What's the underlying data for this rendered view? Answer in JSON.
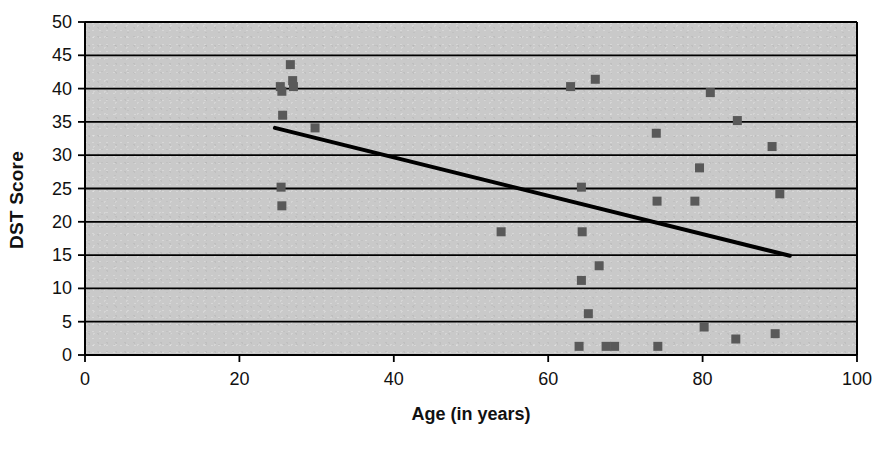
{
  "chart_data": {
    "type": "scatter",
    "title": "",
    "xlabel": "Age (in years)",
    "ylabel": "DST Score",
    "xlim": [
      0,
      100
    ],
    "ylim": [
      0,
      50
    ],
    "xticks": [
      0,
      20,
      40,
      60,
      80,
      100
    ],
    "yticks": [
      0,
      5,
      10,
      15,
      20,
      25,
      30,
      35,
      40,
      45,
      50
    ],
    "grid": "horizontal",
    "legend": "none",
    "plot_background_color": "#c9c9c9",
    "marker_color": "#595959",
    "marker_shape": "square",
    "trendline_color": "#000000",
    "series": [
      {
        "name": "DST Score by Age",
        "points": [
          [
            25.3,
            40.3
          ],
          [
            25.5,
            39.6
          ],
          [
            25.6,
            36.0
          ],
          [
            25.4,
            25.2
          ],
          [
            25.5,
            22.4
          ],
          [
            26.6,
            43.6
          ],
          [
            26.9,
            41.2
          ],
          [
            27.0,
            40.3
          ],
          [
            29.8,
            34.1
          ],
          [
            53.9,
            18.5
          ],
          [
            62.9,
            40.3
          ],
          [
            64.3,
            25.2
          ],
          [
            64.4,
            18.5
          ],
          [
            64.3,
            11.2
          ],
          [
            64.0,
            1.3
          ],
          [
            65.2,
            6.2
          ],
          [
            66.1,
            41.4
          ],
          [
            66.6,
            13.4
          ],
          [
            67.5,
            1.3
          ],
          [
            68.6,
            1.3
          ],
          [
            74.0,
            33.3
          ],
          [
            74.1,
            23.1
          ],
          [
            74.2,
            1.3
          ],
          [
            79.0,
            23.1
          ],
          [
            79.6,
            28.1
          ],
          [
            80.2,
            4.2
          ],
          [
            81.0,
            39.4
          ],
          [
            84.3,
            2.4
          ],
          [
            84.5,
            35.2
          ],
          [
            89.0,
            31.3
          ],
          [
            89.4,
            3.2
          ],
          [
            90.0,
            24.2
          ]
        ]
      }
    ],
    "trendline": {
      "name": "linear-fit",
      "x_start": 24.6,
      "y_start": 34.1,
      "x_end": 91.3,
      "y_end": 14.9
    }
  }
}
